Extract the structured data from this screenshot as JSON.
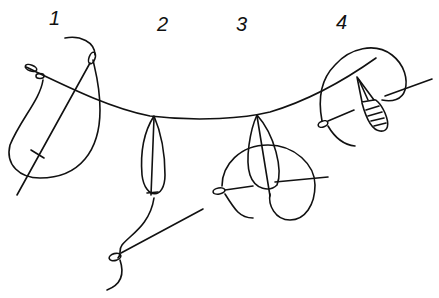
{
  "diagram": {
    "steps": [
      {
        "number": "1",
        "label": "1"
      },
      {
        "number": "2",
        "label": "2"
      },
      {
        "number": "3",
        "label": "3"
      },
      {
        "number": "4",
        "label": "4"
      }
    ],
    "colors": {
      "ink": "#111111",
      "background": "#ffffff"
    }
  }
}
